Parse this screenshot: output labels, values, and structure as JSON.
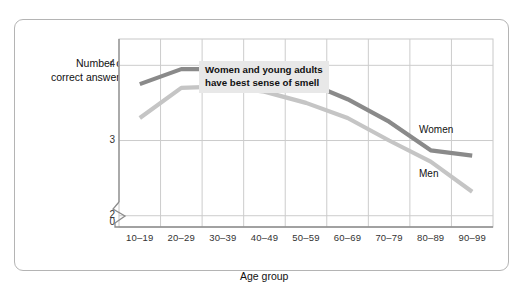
{
  "chart_data": {
    "type": "line",
    "title": "",
    "xlabel": "Age group",
    "ylabel": "Number of correct answers",
    "categories": [
      "10–19",
      "20–29",
      "30–39",
      "40–49",
      "50–59",
      "60–69",
      "70–79",
      "80–89",
      "90–99"
    ],
    "series": [
      {
        "name": "Women",
        "color": "#8a8a8a",
        "values": [
          3.75,
          3.95,
          3.95,
          3.95,
          3.78,
          3.55,
          3.25,
          2.87,
          2.8
        ]
      },
      {
        "name": "Men",
        "color": "#c5c5c5",
        "values": [
          3.3,
          3.7,
          3.72,
          3.65,
          3.5,
          3.3,
          3.0,
          2.72,
          2.32
        ]
      }
    ],
    "ylim": [
      1.85,
      4.35
    ],
    "y_ticks": [
      "0",
      "2",
      "3",
      "4"
    ],
    "y_tick_values": [
      2,
      3,
      4
    ],
    "axis_break": true,
    "grid": true,
    "legend_position": "inline",
    "annotation": "Women and young adults\nhave best sense of smell",
    "gridline_color": "#cccccc",
    "plot_border_color": "#c8c8c8",
    "frame_color": "#b4b4b4"
  },
  "axis": {
    "y_title": "Number of\ncorrect answers",
    "y_title_line1": "Number of",
    "y_title_line2": "correct answers",
    "x_title": "Age group",
    "zero_label": "0"
  },
  "labels": {
    "women": "Women",
    "men": "Men",
    "annotation": "Women and young adults\nhave best sense of smell"
  }
}
